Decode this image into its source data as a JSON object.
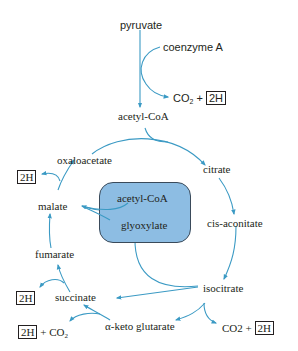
{
  "colors": {
    "arrow": "#3b9ac4",
    "box_fill": "#8dbde3",
    "box_border": "#3a4a5a",
    "text": "#231f20"
  },
  "entry": {
    "pyruvate": "pyruvate",
    "coenzyme_a": "coenzyme A",
    "co2": "CO",
    "co2_sub": "2",
    "plus": "+",
    "two_h": "2H",
    "acetyl_coa": "acetyl-CoA"
  },
  "cycle": {
    "citrate": "citrate",
    "cis_aconitate": "cis-aconitate",
    "isocitrate": "isocitrate",
    "alpha_ketoglutarate": "α-keto glutarate",
    "succinate": "succinate",
    "fumarate": "fumarate",
    "malate": "malate",
    "oxaloacetate": "oxaloacetate"
  },
  "glyoxylate_shunt": {
    "acetyl_coa": "acetyl-CoA",
    "glyoxylate": "glyoxylate"
  },
  "byproducts": {
    "isocitrate_out": {
      "co2": "CO2",
      "plus": "+",
      "two_h": "2H"
    },
    "akg_out": {
      "two_h": "2H",
      "plus": "+",
      "co2": "CO",
      "co2_sub": "2"
    },
    "succinate_out": {
      "two_h": "2H"
    },
    "malate_out": {
      "two_h": "2H"
    }
  }
}
